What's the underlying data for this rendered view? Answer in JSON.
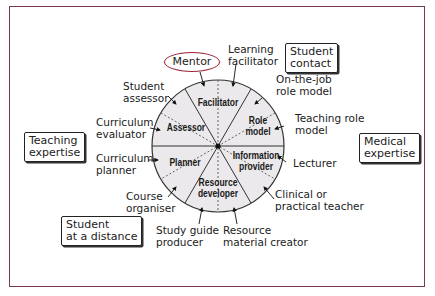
{
  "diagram": {
    "type": "role-wheel",
    "colors": {
      "frame": "#7a3a4e",
      "wheel_fill": "#ebe9eb",
      "mentor_outline": "#9b2335"
    },
    "segments": [
      {
        "label": "Facilitator"
      },
      {
        "label_line1": "Role",
        "label_line2": "model"
      },
      {
        "label_line1": "Information",
        "label_line2": "provider"
      },
      {
        "label_line1": "Resource",
        "label_line2": "developer"
      },
      {
        "label": "Planner"
      },
      {
        "label": "Assessor"
      }
    ],
    "roles": {
      "mentor": "Mentor",
      "learning_facilitator": [
        "Learning",
        "facilitator"
      ],
      "on_the_job_role_model": [
        "On-the-job",
        "role model"
      ],
      "teaching_role_model": [
        "Teaching role",
        "model"
      ],
      "lecturer": "Lecturer",
      "clinical_teacher": [
        "Clinical or",
        "practical teacher"
      ],
      "resource_material_creator": [
        "Resource",
        "material creator"
      ],
      "study_guide_producer": [
        "Study guide",
        "producer"
      ],
      "course_organiser": [
        "Course",
        "organiser"
      ],
      "curriculum_planner": [
        "Curriculum",
        "planner"
      ],
      "curriculum_evaluator": [
        "Curriculum",
        "evaluator"
      ],
      "student_assessor": [
        "Student",
        "assessor"
      ]
    },
    "context_boxes": {
      "student_contact": [
        "Student",
        "contact"
      ],
      "medical_expertise": [
        "Medical",
        "expertise"
      ],
      "teaching_expertise": [
        "Teaching",
        "expertise"
      ],
      "student_at_a_distance": [
        "Student",
        "at a distance"
      ]
    }
  }
}
